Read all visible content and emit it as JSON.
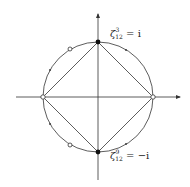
{
  "diagram": {
    "type": "unit-circle-roots-of-unity",
    "labels": {
      "top": {
        "base": "ζ",
        "sup": "3",
        "sub": "12",
        "rhs": "= i"
      },
      "bottom": {
        "base": "ζ",
        "sup": "9",
        "sub": "12",
        "rhs": "= −i"
      }
    },
    "colors": {
      "stroke": "#333333",
      "fill_solid": "#111111",
      "fill_open": "#ffffff"
    }
  }
}
